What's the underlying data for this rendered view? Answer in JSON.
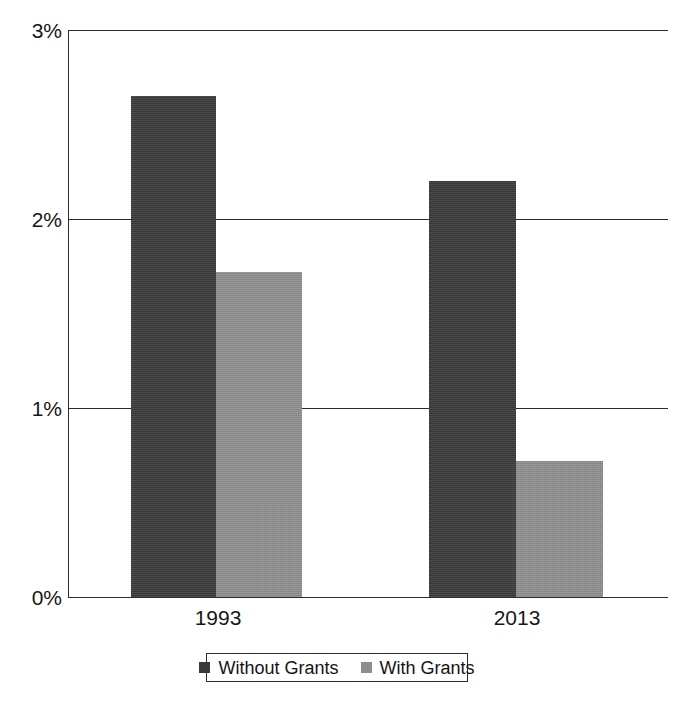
{
  "chart_data": {
    "type": "bar",
    "title": "",
    "subtitle": "",
    "xlabel": "",
    "ylabel": "",
    "categories": [
      "1993",
      "2013"
    ],
    "series": [
      {
        "name": "Without Grants",
        "color": "#3a3a3a",
        "values": [
          2.65,
          2.2
        ]
      },
      {
        "name": "With Grants",
        "color": "#8e8e8e",
        "values": [
          1.72,
          0.72
        ]
      }
    ],
    "ylim": [
      0,
      3
    ],
    "yticks": [
      0,
      1,
      2,
      3
    ],
    "ytick_labels": [
      "0%",
      "1%",
      "2%",
      "3%"
    ],
    "value_format": "percent",
    "grid": "horizontal",
    "legend_position": "bottom",
    "legend_entries": [
      "Without Grants",
      "With Grants"
    ]
  },
  "axis": {
    "y": {
      "ticks": [
        {
          "label": "3%",
          "value": 3
        },
        {
          "label": "2%",
          "value": 2
        },
        {
          "label": "1%",
          "value": 1
        },
        {
          "label": "0%",
          "value": 0
        }
      ]
    },
    "x": {
      "categories": [
        {
          "label": "1993"
        },
        {
          "label": "2013"
        }
      ]
    }
  },
  "legend": {
    "items": [
      {
        "label": "Without Grants",
        "swatch": "dark"
      },
      {
        "label": "With Grants",
        "swatch": "light"
      }
    ]
  },
  "caption": {
    "partial_text": ""
  }
}
